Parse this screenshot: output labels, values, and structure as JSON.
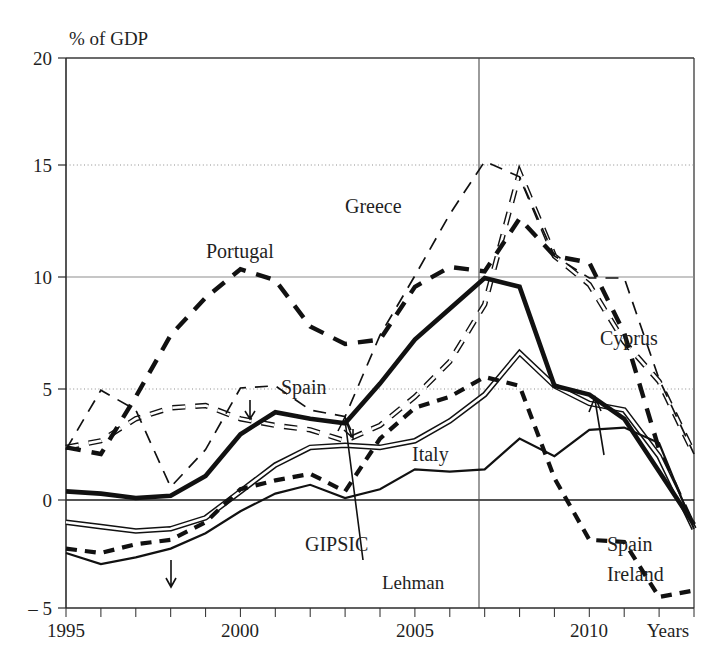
{
  "chart_data": {
    "type": "line",
    "title": "",
    "subtitle": "",
    "xlabel": "Years",
    "ylabel": "% of GDP",
    "ylim": [
      -5,
      20
    ],
    "xlim": [
      1995,
      2013
    ],
    "yticks": [
      -5,
      0,
      5,
      10,
      15,
      20
    ],
    "ytick_labels": [
      "– 5",
      "0",
      "5",
      "10",
      "15",
      "20"
    ],
    "xticks": [
      1995,
      2000,
      2005,
      2010
    ],
    "xtick_labels": [
      "1995",
      "2000",
      "2005",
      "2010"
    ],
    "x_minor_step": 1,
    "grid": "horizontal dotted at 5 and 15, solid at 10, bold zero line at 0",
    "legend_position": "inline labels on curves",
    "annotations": [
      {
        "text": "Lehman",
        "x": 2008,
        "note": "vertical line marking Lehman collapse in 2008"
      },
      {
        "text": "GIPSIC",
        "x": 2004,
        "note": "arrow pointing to bold black aggregate curve"
      }
    ],
    "x": [
      1995,
      1996,
      1997,
      1998,
      1999,
      2000,
      2001,
      2002,
      2003,
      2004,
      2005,
      2006,
      2007,
      2008,
      2009,
      2010,
      2011,
      2012,
      2013
    ],
    "series": [
      {
        "name": "GIPSIC",
        "style": "thick solid black",
        "values": [
          0.3,
          0.2,
          0.0,
          0.1,
          1.0,
          2.9,
          3.9,
          3.6,
          3.4,
          5.2,
          7.2,
          8.6,
          10.0,
          9.6,
          5.1,
          4.7,
          3.6,
          1.2,
          -1.2
        ]
      },
      {
        "name": "Portugal",
        "style": "thick black dashed",
        "values": [
          2.3,
          2.0,
          4.6,
          7.4,
          9.1,
          10.4,
          9.9,
          7.8,
          7.0,
          7.2,
          9.6,
          10.5,
          10.3,
          12.7,
          11.0,
          10.7,
          7.5,
          2.2,
          -1.3
        ]
      },
      {
        "name": "Greece",
        "style": "thin black dashed",
        "values": [
          2.2,
          4.9,
          4.0,
          0.5,
          2.2,
          5.0,
          5.1,
          4.0,
          3.7,
          7.4,
          10.1,
          12.9,
          15.3,
          14.6,
          11.0,
          10.0,
          10.0,
          5.4,
          2.0
        ]
      },
      {
        "name": "Cyprus",
        "style": "white hollow dashed",
        "values": [
          2.3,
          2.6,
          3.6,
          4.1,
          4.2,
          3.6,
          3.3,
          3.1,
          2.6,
          3.3,
          4.6,
          6.2,
          8.8,
          14.8,
          11.0,
          9.7,
          7.1,
          5.3,
          2.0
        ]
      },
      {
        "name": "Spain",
        "style": "double white-filled solid line",
        "values": [
          -1.1,
          -1.3,
          -1.5,
          -1.4,
          -0.9,
          0.3,
          1.5,
          2.3,
          2.4,
          2.3,
          2.6,
          3.5,
          4.7,
          6.6,
          5.1,
          4.3,
          4.0,
          1.9,
          -1.4
        ]
      },
      {
        "name": "Italy",
        "style": "medium solid black",
        "values": [
          -2.5,
          -3.0,
          -2.7,
          -2.3,
          -1.6,
          -0.6,
          0.2,
          0.6,
          0.0,
          0.4,
          1.3,
          1.2,
          1.3,
          2.7,
          1.9,
          3.1,
          3.2,
          2.5,
          -1.4
        ]
      },
      {
        "name": "Ireland",
        "style": "thick black short-dashed",
        "values": [
          -2.3,
          -2.5,
          -2.1,
          -1.9,
          -1.1,
          0.4,
          0.8,
          1.1,
          0.3,
          2.7,
          4.1,
          4.6,
          5.5,
          5.1,
          0.9,
          -1.9,
          -2.0,
          -4.5,
          -4.2
        ]
      }
    ]
  },
  "labels": {
    "y_axis_title": "% of GDP",
    "x_axis_title": "Years",
    "portugal": "Portugal",
    "greece": "Greece",
    "cyprus": "Cyprus",
    "spain_mid": "Spain",
    "spain_right": "Spain",
    "italy": "Italy",
    "ireland": "Ireland",
    "gipsic": "GIPSIC",
    "lehman": "Lehman"
  },
  "ytick_labels": {
    "t20": "20",
    "t15": "15",
    "t10": "10",
    "t5": "5",
    "t0": "0",
    "tm5": "– 5"
  },
  "xtick_labels": {
    "t1995": "1995",
    "t2000": "2000",
    "t2005": "2005",
    "t2010": "2010"
  },
  "colors": {
    "ink": "#111111",
    "grid": "#8d8d8d",
    "background": "#ffffff"
  }
}
